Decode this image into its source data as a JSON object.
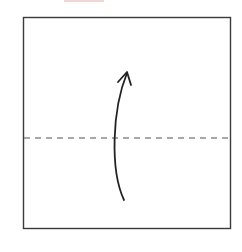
{
  "diagram": {
    "type": "origami-fold-step",
    "colors": {
      "stroke": "#3a3a3a",
      "dashed": "#555555",
      "arrow": "#222222",
      "background": "#ffffff",
      "top_sliver": "#f3d6d6"
    },
    "square": {
      "x": 23,
      "y": 17,
      "width": 208,
      "height": 212
    },
    "fold_line": {
      "style": "dashed",
      "y": 138,
      "x1": 23,
      "x2": 231
    },
    "arrow": {
      "direction": "up",
      "start": [
        124,
        200
      ],
      "end": [
        127,
        72
      ],
      "icon": "curved-arrow-up-icon"
    }
  }
}
